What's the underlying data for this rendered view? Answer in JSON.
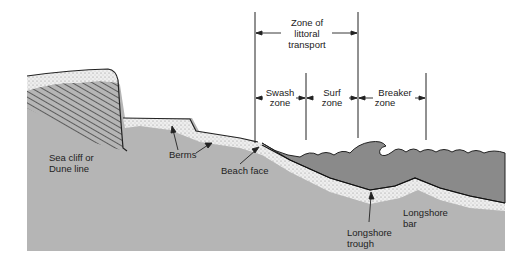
{
  "diagram": {
    "colors": {
      "background": "#ffffff",
      "land": "#b5b5b5",
      "sand": "#e6e6e6",
      "water": "#8a8a8a",
      "cliff_hatch": "#555555",
      "line": "#222222"
    },
    "zones": {
      "littoral": {
        "line1": "Zone of",
        "line2": "littoral",
        "line3": "transport"
      },
      "swash": {
        "line1": "Swash",
        "line2": "zone"
      },
      "surf": {
        "line1": "Surf",
        "line2": "zone"
      },
      "breaker": {
        "line1": "Breaker",
        "line2": "zone"
      }
    },
    "labels": {
      "sea_cliff": {
        "line1": "Sea cliff or",
        "line2": "Dune line"
      },
      "berms": "Berms",
      "beach_face": "Beach face",
      "longshore_trough": {
        "line1": "Longshore",
        "line2": "trough"
      },
      "longshore_bar": {
        "line1": "Longshore",
        "line2": "bar"
      }
    }
  }
}
